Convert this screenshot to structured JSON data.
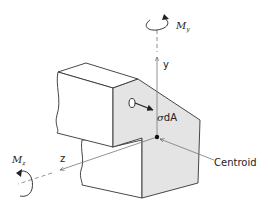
{
  "diagram": {
    "labels": {
      "moment_y": "M",
      "moment_y_sub": "y",
      "moment_z": "M",
      "moment_z_sub": "z",
      "axis_y": "y",
      "axis_z": "z",
      "stress_element": "σdA",
      "centroid": "Centroid"
    },
    "colors": {
      "face_fill": "#e4e4e4",
      "line": "#333333",
      "axis": "#666666"
    }
  }
}
